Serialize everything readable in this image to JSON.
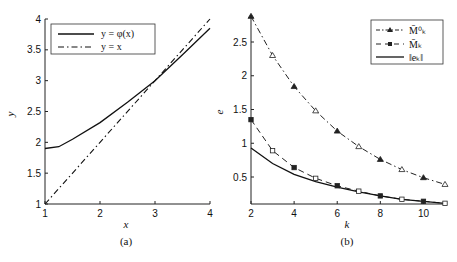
{
  "chart_data": [
    {
      "type": "line",
      "panel": "(a)",
      "xlabel": "x",
      "ylabel": "y",
      "xlim": [
        1,
        4
      ],
      "ylim": [
        1,
        4
      ],
      "xticks": [
        "1",
        "2",
        "3",
        "4"
      ],
      "yticks": [
        "1",
        "1.5",
        "2",
        "2.5",
        "3",
        "3.5",
        "4"
      ],
      "legend_position": "upper left",
      "series": [
        {
          "name": "y = φ(x)",
          "style": "solid",
          "x": [
            1,
            1.25,
            1.5,
            2,
            2.5,
            3,
            3.5,
            4
          ],
          "y": [
            1.9,
            1.93,
            2.05,
            2.32,
            2.65,
            3.0,
            3.42,
            3.85
          ]
        },
        {
          "name": "y = x",
          "style": "dash-dot",
          "x": [
            1,
            4
          ],
          "y": [
            1,
            4
          ]
        }
      ]
    },
    {
      "type": "line",
      "panel": "(b)",
      "xlabel": "k",
      "ylabel": "e",
      "xlim": [
        2,
        11
      ],
      "ylim": [
        0.1,
        2.9
      ],
      "xticks": [
        "2",
        "4",
        "6",
        "8",
        "10"
      ],
      "yticks": [
        "0.5",
        "1",
        "1.5",
        "2",
        "2.5"
      ],
      "legend_position": "upper right",
      "series": [
        {
          "name": "M̄⁰_k",
          "style": "dash-dot",
          "marker": "triangle",
          "x": [
            2,
            3,
            4,
            5,
            6,
            7,
            8,
            9,
            10,
            11
          ],
          "y": [
            2.88,
            2.3,
            1.84,
            1.48,
            1.18,
            0.95,
            0.76,
            0.61,
            0.49,
            0.39
          ]
        },
        {
          "name": "M̄_k",
          "style": "dashed",
          "marker": "square",
          "x": [
            2,
            3,
            4,
            5,
            6,
            7,
            8,
            9,
            10,
            11
          ],
          "y": [
            1.35,
            0.89,
            0.64,
            0.48,
            0.37,
            0.29,
            0.22,
            0.17,
            0.14,
            0.11
          ]
        },
        {
          "name": "‖e_k‖",
          "style": "solid",
          "x": [
            2,
            3,
            4,
            5,
            6,
            7,
            8,
            9,
            10,
            11
          ],
          "y": [
            0.93,
            0.7,
            0.54,
            0.43,
            0.35,
            0.28,
            0.22,
            0.17,
            0.14,
            0.11
          ]
        }
      ]
    }
  ],
  "labels": {
    "a": {
      "caption": "(a)",
      "xlabel": "x",
      "ylabel": "y",
      "legend": [
        "y = φ(x)",
        "y = x"
      ]
    },
    "b": {
      "caption": "(b)",
      "xlabel": "k",
      "ylabel": "e",
      "legend": [
        "M̄⁰ₖ",
        "M̄ₖ",
        "‖eₖ‖"
      ]
    }
  }
}
